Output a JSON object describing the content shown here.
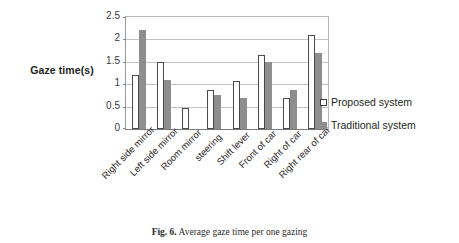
{
  "figure": {
    "caption_label": "Fig. 6.",
    "caption_text": " Average gaze time per one gazing"
  },
  "legend": {
    "position": "right",
    "items": [
      {
        "label": "Proposed system",
        "marker": "open-square",
        "color": "#ffffff"
      },
      {
        "label": "Traditional system",
        "marker": "filled-square",
        "color": "#8e8e8e"
      }
    ]
  },
  "chart_data": {
    "type": "bar",
    "title": "",
    "xlabel": "",
    "ylabel": "Gaze time(s)",
    "ylim": [
      0,
      2.5
    ],
    "yticks": [
      "0",
      "0.5",
      "1",
      "1.5",
      "2",
      "2.5"
    ],
    "ytick_values": [
      0,
      0.5,
      1,
      1.5,
      2,
      2.5
    ],
    "grid": true,
    "legend_position": "right",
    "categories": [
      "Right side mirror",
      "Left side mirror",
      "Room mirror",
      "steering",
      "Shift lever",
      "Front of car",
      "Right of car",
      "Right rear of car"
    ],
    "series": [
      {
        "name": "Proposed system",
        "color": "#ffffff",
        "values": [
          1.2,
          1.5,
          0.47,
          0.86,
          1.07,
          1.66,
          0.7,
          2.1
        ]
      },
      {
        "name": "Traditional system",
        "color": "#8e8e8e",
        "values": [
          2.2,
          1.1,
          0,
          0.76,
          0.7,
          1.5,
          0.87,
          1.7
        ]
      }
    ]
  }
}
